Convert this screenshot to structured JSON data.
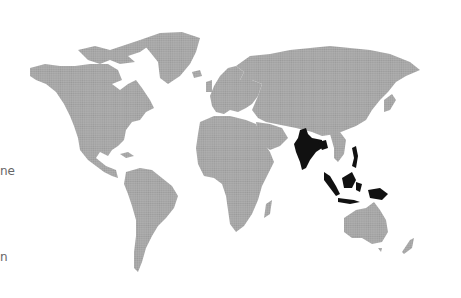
{
  "left_text_fragments": [
    {
      "text": "ne",
      "x": 0,
      "y": 164
    },
    {
      "text": "n",
      "x": 0,
      "y": 250
    }
  ],
  "map": {
    "projection": "world",
    "land_color": "#a3a3a3",
    "highlight_color": "#111111",
    "background": "#ffffff",
    "highlighted_regions": [
      "India",
      "Bangladesh",
      "Myanmar coast",
      "Malaysia",
      "Indonesia",
      "Philippines",
      "Papua New Guinea"
    ]
  }
}
